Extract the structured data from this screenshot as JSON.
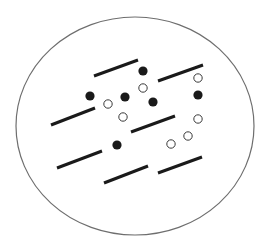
{
  "diagram": {
    "width": 269,
    "height": 245,
    "background": "#ffffff",
    "boundary": {
      "shape": "ellipse",
      "cx": 135,
      "cy": 126,
      "rx": 119,
      "ry": 109,
      "stroke": "#6e6e6e",
      "stroke_width": 1.2
    },
    "rods": {
      "stroke": "#1a1a1a",
      "stroke_width": 3,
      "items": [
        {
          "x1": 94,
          "y1": 76,
          "x2": 138,
          "y2": 60
        },
        {
          "x1": 158,
          "y1": 81,
          "x2": 203,
          "y2": 65
        },
        {
          "x1": 51,
          "y1": 125,
          "x2": 95,
          "y2": 108
        },
        {
          "x1": 131,
          "y1": 132,
          "x2": 175,
          "y2": 116
        },
        {
          "x1": 57,
          "y1": 168,
          "x2": 102,
          "y2": 151
        },
        {
          "x1": 104,
          "y1": 183,
          "x2": 148,
          "y2": 166
        },
        {
          "x1": 158,
          "y1": 173,
          "x2": 202,
          "y2": 157
        }
      ]
    },
    "filled_particles": {
      "fill": "#1a1a1a",
      "r": 4.6,
      "items": [
        {
          "cx": 143,
          "cy": 71
        },
        {
          "cx": 90,
          "cy": 96
        },
        {
          "cx": 125,
          "cy": 97
        },
        {
          "cx": 153,
          "cy": 102
        },
        {
          "cx": 198,
          "cy": 95
        },
        {
          "cx": 117,
          "cy": 145
        }
      ]
    },
    "open_particles": {
      "stroke": "#3a3a3a",
      "fill": "#ffffff",
      "stroke_width": 1,
      "r": 4.2,
      "items": [
        {
          "cx": 143,
          "cy": 88
        },
        {
          "cx": 198,
          "cy": 78
        },
        {
          "cx": 108,
          "cy": 104
        },
        {
          "cx": 123,
          "cy": 117
        },
        {
          "cx": 198,
          "cy": 119
        },
        {
          "cx": 188,
          "cy": 136
        },
        {
          "cx": 171,
          "cy": 144
        }
      ]
    }
  }
}
